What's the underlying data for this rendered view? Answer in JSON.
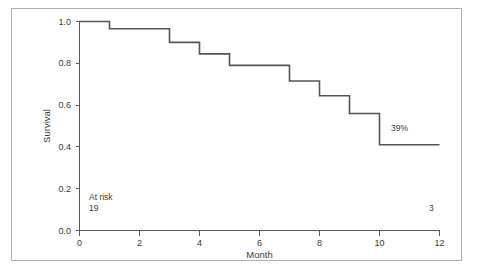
{
  "figure": {
    "background_color": "#ffffff",
    "border_color": "#b0b0b0",
    "curve_color": "#555555",
    "axis_color": "#5a5a5a",
    "text_color": "#3a3a3a"
  },
  "chart_data": {
    "type": "line",
    "subtype": "kaplan-meier-step",
    "title": "",
    "xlabel": "Month",
    "ylabel": "Survival",
    "xlim": [
      0,
      12
    ],
    "ylim": [
      0.0,
      1.0
    ],
    "xticks": [
      0,
      2,
      4,
      6,
      8,
      10,
      12
    ],
    "xticklabels": [
      "0",
      "2",
      "4",
      "6",
      "8",
      "10",
      "12"
    ],
    "yticks": [
      0.0,
      0.2,
      0.4,
      0.6,
      0.8,
      1.0
    ],
    "yticklabels": [
      "0.0",
      "0.2",
      "0.4",
      "0.6",
      "0.8",
      "1.0"
    ],
    "grid": false,
    "legend": false,
    "series": [
      {
        "name": "Survival",
        "x": [
          0,
          1,
          1,
          3,
          3,
          4,
          4,
          5,
          5,
          7,
          7,
          8,
          8,
          9,
          9,
          10,
          10,
          12
        ],
        "y": [
          1.0,
          1.0,
          0.965,
          0.965,
          0.9,
          0.9,
          0.845,
          0.845,
          0.79,
          0.79,
          0.715,
          0.715,
          0.645,
          0.645,
          0.56,
          0.56,
          0.41,
          0.41
        ],
        "step_points": [
          {
            "month": 0,
            "survival": 1.0
          },
          {
            "month": 1,
            "survival": 0.965
          },
          {
            "month": 3,
            "survival": 0.9
          },
          {
            "month": 4,
            "survival": 0.845
          },
          {
            "month": 5,
            "survival": 0.79
          },
          {
            "month": 7,
            "survival": 0.715
          },
          {
            "month": 8,
            "survival": 0.645
          },
          {
            "month": 9,
            "survival": 0.56
          },
          {
            "month": 10,
            "survival": 0.41
          },
          {
            "month": 12,
            "survival": 0.41
          }
        ]
      }
    ],
    "annotations": [
      {
        "id": "final-survival",
        "text": "39%",
        "x": 10.6,
        "y": 0.47
      },
      {
        "id": "at-risk-title",
        "text": "At risk",
        "x": 0.35,
        "y": 0.155
      },
      {
        "id": "at-risk-start",
        "text": "19",
        "x": 0.35,
        "y": 0.095
      },
      {
        "id": "at-risk-end",
        "text": "3",
        "x": 11.75,
        "y": 0.095
      }
    ],
    "at_risk": {
      "label": "At risk",
      "counts": [
        {
          "month": 0,
          "count": "19"
        },
        {
          "month": 12,
          "count": "3"
        }
      ]
    }
  }
}
